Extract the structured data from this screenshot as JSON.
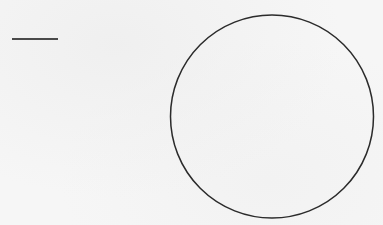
{
  "diagram": {
    "background_color": "#f6f6f6",
    "stroke_color": "#2b2b2b",
    "shapes": [
      {
        "kind": "line-segment",
        "x1": 12,
        "y1": 39,
        "x2": 58,
        "y2": 39,
        "stroke_width": 2,
        "color": "#4a4a4a"
      },
      {
        "kind": "circle",
        "cx": 272,
        "cy": 116.5,
        "r": 101.5,
        "stroke_width": 1.5,
        "color": "#2b2b2b",
        "fill": "none"
      }
    ],
    "labels": {
      "line": "horizontal line segment",
      "circle": "circle outline"
    }
  }
}
